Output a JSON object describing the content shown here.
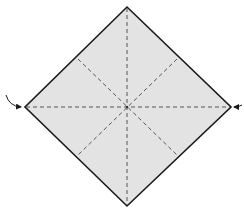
{
  "diagram": {
    "type": "origami-fold-diagram",
    "paper": {
      "shape": "square-rotated-45",
      "fill": "#e3e3e3",
      "stroke": "#1a1a1a",
      "vertices": {
        "top": [
          127,
          7
        ],
        "right": [
          231,
          107
        ],
        "bottom": [
          127,
          206
        ],
        "left": [
          25,
          107
        ]
      }
    },
    "creases": {
      "style": "valley-fold-dashed",
      "color": "#555555",
      "lines": [
        {
          "name": "vertical",
          "from": [
            127,
            8
          ],
          "to": [
            127,
            205
          ]
        },
        {
          "name": "horizontal",
          "from": [
            26,
            107
          ],
          "to": [
            230,
            107
          ]
        },
        {
          "name": "diagonal-tl-br",
          "from": [
            78,
            59
          ],
          "to": [
            178,
            156
          ]
        },
        {
          "name": "diagonal-tr-bl",
          "from": [
            177,
            59
          ],
          "to": [
            77,
            156
          ]
        }
      ]
    },
    "arrows": [
      {
        "name": "left-fold-arrow",
        "side": "left",
        "target": [
          24,
          107
        ]
      },
      {
        "name": "right-fold-arrow",
        "side": "right",
        "target": [
          233,
          107
        ]
      }
    ]
  }
}
